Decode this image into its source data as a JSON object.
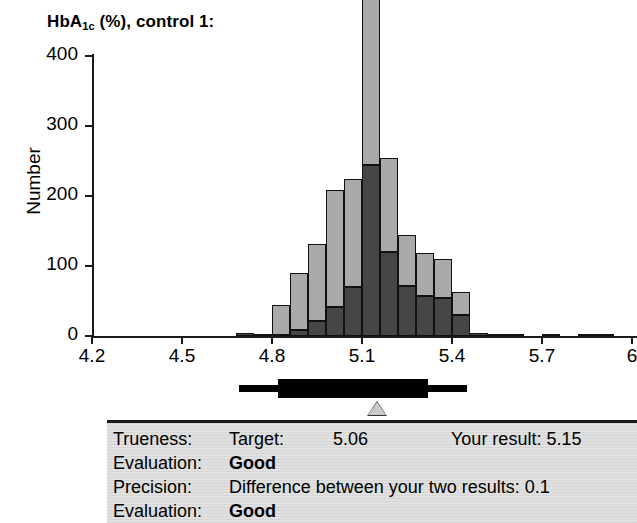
{
  "chart_data": {
    "type": "bar",
    "title": "HbA1c (%), control 1:",
    "title_main": "HbA",
    "title_sub": "1c",
    "title_rest": " (%), control 1:",
    "xlabel": "",
    "ylabel": "Number",
    "xlim": [
      4.2,
      6.0
    ],
    "ylim": [
      0,
      400
    ],
    "xticks": [
      "4.2",
      "4.5",
      "4.8",
      "5.1",
      "5.4",
      "5.7",
      "6"
    ],
    "xtick_values": [
      4.2,
      4.5,
      4.8,
      5.1,
      5.4,
      5.7,
      6.0
    ],
    "yticks": [
      "0",
      "100",
      "200",
      "300",
      "400"
    ],
    "ytick_values": [
      0,
      100,
      200,
      300,
      400
    ],
    "grid": false,
    "legend": "none",
    "stacked": true,
    "bin_width": 0.06,
    "series": [
      {
        "name": "lower-segment",
        "color": "#464646"
      },
      {
        "name": "upper-segment",
        "color": "#a9a9a9"
      }
    ],
    "bins": [
      {
        "x": 4.68,
        "dark": 5,
        "light": 0
      },
      {
        "x": 4.74,
        "dark": 2,
        "light": 0
      },
      {
        "x": 4.8,
        "dark": 2,
        "light": 42
      },
      {
        "x": 4.86,
        "dark": 8,
        "light": 82
      },
      {
        "x": 4.92,
        "dark": 22,
        "light": 110
      },
      {
        "x": 4.98,
        "dark": 42,
        "light": 167
      },
      {
        "x": 5.04,
        "dark": 70,
        "light": 154
      },
      {
        "x": 5.1,
        "dark": 245,
        "light": 351
      },
      {
        "x": 5.16,
        "dark": 120,
        "light": 134
      },
      {
        "x": 5.22,
        "dark": 72,
        "light": 72
      },
      {
        "x": 5.28,
        "dark": 57,
        "light": 62
      },
      {
        "x": 5.34,
        "dark": 55,
        "light": 55
      },
      {
        "x": 5.4,
        "dark": 30,
        "light": 33
      },
      {
        "x": 5.46,
        "dark": 4,
        "light": 0
      },
      {
        "x": 5.52,
        "dark": 3,
        "light": 0
      },
      {
        "x": 5.58,
        "dark": 2,
        "light": 0
      },
      {
        "x": 5.7,
        "dark": 2,
        "light": 0
      },
      {
        "x": 5.82,
        "dark": 2,
        "light": 0
      },
      {
        "x": 5.88,
        "dark": 2,
        "light": 0
      }
    ],
    "range_indicator": {
      "name": "acceptance-range-bar",
      "outer_from": 4.69,
      "outer_to": 5.45,
      "inner_from": 4.82,
      "inner_to": 5.32,
      "marker_value": 5.15,
      "marker_name": "your-result-marker"
    }
  },
  "panel": {
    "rows": [
      {
        "label": "Trueness:",
        "mid": "Target:",
        "value": "5.06",
        "right": "Your result: 5.15",
        "bold": false
      },
      {
        "label": "Evaluation:",
        "mid": "Good",
        "value": "",
        "right": "",
        "bold": true
      },
      {
        "label": "Precision:",
        "mid": "Difference between your two results: 0.1",
        "value": "",
        "right": "",
        "bold": false
      },
      {
        "label": "Evaluation:",
        "mid": "Good",
        "value": "",
        "right": "",
        "bold": true
      }
    ]
  },
  "colors": {
    "bar_dark": "#464646",
    "bar_light": "#a9a9a9",
    "axis": "#1a1a1a",
    "panel_bg": "#e0e0e0",
    "marker_fill": "#c9c9c9"
  }
}
